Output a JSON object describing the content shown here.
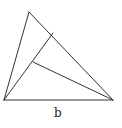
{
  "diagram": {
    "type": "geometry-triangle",
    "vertices": {
      "apex": {
        "x": 29,
        "y": 12
      },
      "bottom_left": {
        "x": 4,
        "y": 100
      },
      "bottom_right": {
        "x": 113,
        "y": 100
      }
    },
    "inner_points": {
      "foot_on_right_side": {
        "x": 53,
        "y": 33
      },
      "point_on_cevian": {
        "x": 33,
        "y": 62
      }
    },
    "segments": [
      {
        "from": "apex",
        "to": "bottom_left"
      },
      {
        "from": "apex",
        "to": "bottom_right"
      },
      {
        "from": "bottom_left",
        "to": "bottom_right"
      },
      {
        "from": "bottom_left",
        "to": "foot_on_right_side"
      },
      {
        "from": "point_on_cevian",
        "to": "bottom_right"
      }
    ],
    "labels": [
      {
        "text": "b",
        "x": 57,
        "y": 116,
        "refers_to": "bottom side"
      }
    ],
    "stroke_color": "#333333"
  }
}
